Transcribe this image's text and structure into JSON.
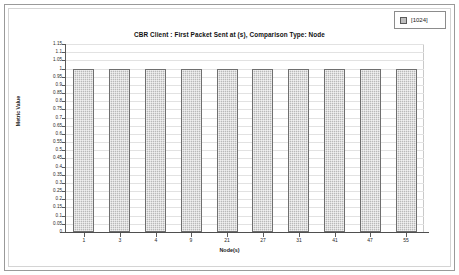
{
  "legend": {
    "swatch_icon": "series-swatch-icon",
    "label": "[1024]"
  },
  "chart_data": {
    "type": "bar",
    "title": "CBR Client :  First Packet Sent at (s), Comparison Type: Node",
    "xlabel": "Node(s)",
    "ylabel": "Metric Value",
    "categories": [
      "1",
      "3",
      "4",
      "9",
      "21",
      "27",
      "31",
      "41",
      "47",
      "55"
    ],
    "values": [
      1,
      1,
      1,
      1,
      1,
      1,
      1,
      1,
      1,
      1
    ],
    "series": [
      {
        "name": "[1024]",
        "values": [
          1,
          1,
          1,
          1,
          1,
          1,
          1,
          1,
          1,
          1
        ]
      }
    ],
    "ylim": [
      0,
      1.15
    ],
    "ytick_labels": [
      "1.15",
      "1.1",
      "1.05",
      "1",
      "0.95",
      "0.9",
      "0.85",
      "0.8",
      "0.75",
      "0.7",
      "0.65",
      "0.6",
      "0.55",
      "0.5",
      "0.45",
      "0.4",
      "0.35",
      "0.3",
      "0.25",
      "0.2",
      "0.15",
      "0.1",
      "0.05",
      "0"
    ],
    "ytick_values": [
      1.15,
      1.1,
      1.05,
      1,
      0.95,
      0.9,
      0.85,
      0.8,
      0.75,
      0.7,
      0.65,
      0.6,
      0.55,
      0.5,
      0.45,
      0.4,
      0.35,
      0.3,
      0.25,
      0.2,
      0.15,
      0.1,
      0.05,
      0
    ],
    "grid": true,
    "legend_position": "top-right",
    "bar_color": "#b9b9b9",
    "bar_border_color": "#6f6f6f",
    "grid_color": "#e2e2e2",
    "axis_color": "#5a5a5a"
  }
}
